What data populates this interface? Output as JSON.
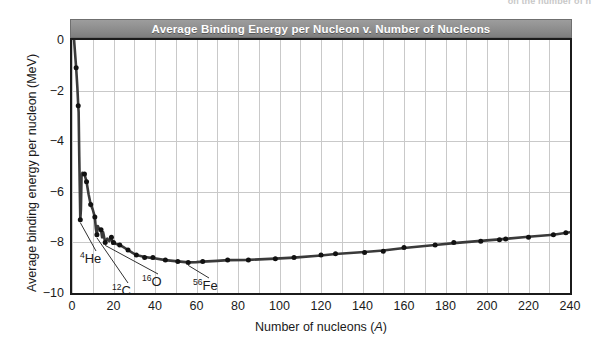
{
  "page": {
    "cutoff_text_above": "on the number of n"
  },
  "chart_data": {
    "type": "line",
    "title": "Average Binding Energy per Nucleon v. Number of Nucleons",
    "subtitle": "",
    "xlabel": "Number of nucleons (A)",
    "ylabel": "Average binding energy per nucleon (MeV)",
    "xlim": [
      0,
      240
    ],
    "ylim": [
      -10,
      0
    ],
    "grid": true,
    "legend": null,
    "x_ticks": [
      0,
      20,
      40,
      60,
      80,
      100,
      120,
      140,
      160,
      180,
      200,
      220,
      240
    ],
    "x_tick_labels": [
      "0",
      "20",
      "40",
      "60",
      "80",
      "100",
      "120",
      "140",
      "160",
      "180",
      "200",
      "220",
      "240"
    ],
    "x_minor_step": 10,
    "y_ticks": [
      0,
      -2,
      -4,
      -6,
      -8,
      -10
    ],
    "y_tick_labels": [
      "0",
      "−2",
      "−4",
      "−6",
      "−8",
      "−10"
    ],
    "series": [
      {
        "name": "Average binding energy per nucleon",
        "color": "#3a3a3a",
        "marker": "circle",
        "marker_color": "#111111",
        "x": [
          1,
          2,
          3,
          4,
          6,
          7,
          9,
          11,
          12,
          14,
          16,
          19,
          20,
          23,
          27,
          31,
          35,
          39,
          45,
          51,
          56,
          63,
          75,
          85,
          98,
          107,
          120,
          127,
          141,
          150,
          160,
          175,
          184,
          197,
          206,
          209,
          220,
          232,
          238
        ],
        "y": [
          0.0,
          -1.1,
          -2.6,
          -7.1,
          -5.3,
          -5.6,
          -6.5,
          -7.0,
          -7.7,
          -7.5,
          -8.0,
          -7.8,
          -8.0,
          -8.1,
          -8.3,
          -8.5,
          -8.6,
          -8.6,
          -8.7,
          -8.75,
          -8.79,
          -8.75,
          -8.7,
          -8.7,
          -8.65,
          -8.6,
          -8.5,
          -8.45,
          -8.4,
          -8.35,
          -8.2,
          -8.1,
          -8.0,
          -7.95,
          -7.9,
          -7.87,
          -7.8,
          -7.7,
          -7.62
        ]
      }
    ],
    "curve_points": [
      [
        1,
        0.0
      ],
      [
        2,
        -1.1
      ],
      [
        2.6,
        -1.9
      ],
      [
        3,
        -2.6
      ],
      [
        3.2,
        -2.85
      ],
      [
        3.5,
        -4.6
      ],
      [
        4,
        -7.1
      ],
      [
        4.3,
        -6.7
      ],
      [
        4.6,
        -5.4
      ],
      [
        5,
        -5.25
      ],
      [
        6,
        -5.3
      ],
      [
        7,
        -5.6
      ],
      [
        8,
        -6.1
      ],
      [
        9,
        -6.5
      ],
      [
        10,
        -6.7
      ],
      [
        11,
        -7.0
      ],
      [
        11.5,
        -7.45
      ],
      [
        12,
        -7.7
      ],
      [
        12.4,
        -7.35
      ],
      [
        13,
        -7.45
      ],
      [
        14,
        -7.5
      ],
      [
        14.5,
        -7.8
      ],
      [
        15,
        -7.6
      ],
      [
        16,
        -8.0
      ],
      [
        17,
        -7.85
      ],
      [
        18,
        -7.95
      ],
      [
        19,
        -7.8
      ],
      [
        19.6,
        -8.05
      ],
      [
        20,
        -8.0
      ],
      [
        21,
        -8.05
      ],
      [
        23,
        -8.1
      ],
      [
        25,
        -8.2
      ],
      [
        27,
        -8.3
      ],
      [
        29,
        -8.4
      ],
      [
        31,
        -8.5
      ],
      [
        35,
        -8.58
      ],
      [
        39,
        -8.62
      ],
      [
        45,
        -8.7
      ],
      [
        51,
        -8.75
      ],
      [
        56,
        -8.79
      ],
      [
        60,
        -8.78
      ],
      [
        63,
        -8.76
      ],
      [
        70,
        -8.73
      ],
      [
        75,
        -8.7
      ],
      [
        85,
        -8.69
      ],
      [
        98,
        -8.64
      ],
      [
        107,
        -8.6
      ],
      [
        120,
        -8.52
      ],
      [
        127,
        -8.46
      ],
      [
        141,
        -8.38
      ],
      [
        150,
        -8.32
      ],
      [
        160,
        -8.22
      ],
      [
        175,
        -8.1
      ],
      [
        184,
        -8.03
      ],
      [
        197,
        -7.94
      ],
      [
        206,
        -7.88
      ],
      [
        209,
        -7.86
      ],
      [
        220,
        -7.78
      ],
      [
        232,
        -7.7
      ],
      [
        240,
        -7.6
      ]
    ],
    "annotations": [
      {
        "id": "he4",
        "element": "He",
        "mass_number": "4",
        "label": "⁴He",
        "point": [
          4,
          -7.1
        ],
        "text_position": [
          80,
          252
        ]
      },
      {
        "id": "c12",
        "element": "C",
        "mass_number": "12",
        "label": "¹²C",
        "point": [
          12,
          -7.7
        ],
        "text_position": [
          112,
          284
        ]
      },
      {
        "id": "o16",
        "element": "O",
        "mass_number": "16",
        "label": "¹⁶O",
        "point": [
          16,
          -8.0
        ],
        "text_position": [
          142,
          275
        ]
      },
      {
        "id": "fe56",
        "element": "Fe",
        "mass_number": "56",
        "label": "⁵⁶Fe",
        "point": [
          56,
          -8.79
        ],
        "text_position": [
          193,
          279
        ]
      }
    ],
    "style": {
      "title_bar_color": "#8d8d8d",
      "title_text_color": "#ffffff",
      "plot_border_color": "#1b1b1b",
      "grid_color": "#c9c9c9",
      "background_color": "#ffffff",
      "curve_color": "#3a3a3a"
    }
  }
}
